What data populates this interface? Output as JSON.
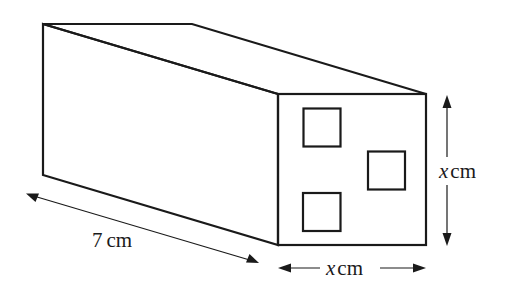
{
  "figure": {
    "colors": {
      "stroke": "#1a1a1a",
      "front_face_fill": "#b5b5b5",
      "hole_fill": "#ffffff",
      "background": "#ffffff"
    },
    "cuboid": {
      "length_label_number": "7",
      "length_label_unit": "cm",
      "width_label_var": "x",
      "width_label_unit": "cm",
      "height_label_var": "x",
      "height_label_unit": "cm"
    },
    "holes_count": 3
  }
}
